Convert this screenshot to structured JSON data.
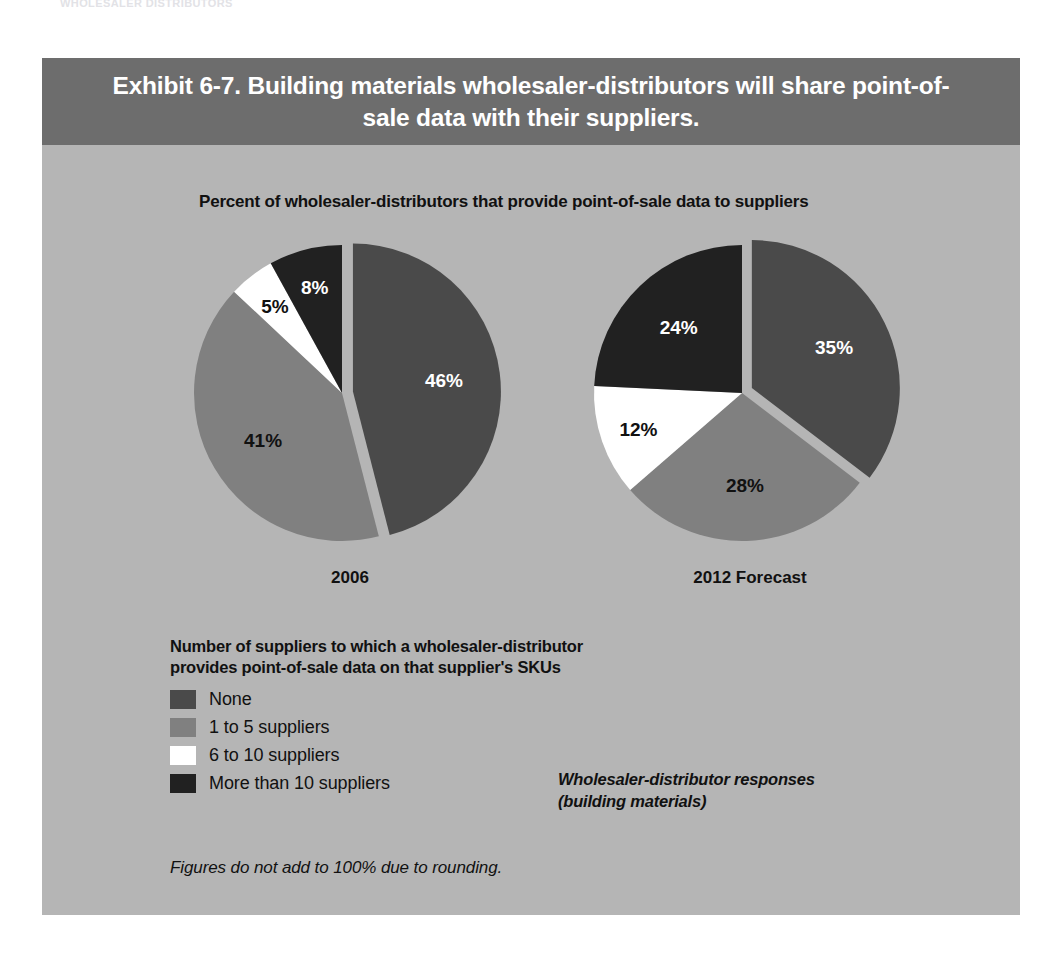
{
  "scan_header_text": "WHOLESALER  DISTRIBUTORS",
  "panel": {
    "title": "Exhibit 6-7. Building materials wholesaler-distributors will share point-of-sale data with their suppliers.",
    "subtitle": "Percent of wholesaler-distributors that provide point-of-sale data to suppliers",
    "source_note_line1": "Wholesaler-distributor responses",
    "source_note_line2": "(building materials)",
    "footnote": "Figures do not add to 100% due to rounding."
  },
  "legend": {
    "title_line1": "Number of suppliers to which a wholesaler-distributor",
    "title_line2": "provides point-of-sale data on that supplier's SKUs",
    "items": [
      {
        "label": "None",
        "color": "#4a4a4a"
      },
      {
        "label": "1 to 5 suppliers",
        "color": "#808080"
      },
      {
        "label": "6 to 10 suppliers",
        "color": "#ffffff"
      },
      {
        "label": "More than 10 suppliers",
        "color": "#212121"
      }
    ]
  },
  "colors": {
    "panel_background": "#b5b5b5",
    "header_band": "#6d6d6d",
    "none": "#4a4a4a",
    "one_to_five": "#808080",
    "six_to_ten": "#ffffff",
    "more_than_ten": "#212121",
    "text_dark": "#111111",
    "text_light": "#ffffff"
  },
  "chart_data": [
    {
      "type": "pie",
      "title": "2006",
      "categories": [
        "None",
        "1 to 5 suppliers",
        "6 to 10 suppliers",
        "More than 10 suppliers"
      ],
      "values": [
        46,
        41,
        5,
        8
      ],
      "labels": [
        "46%",
        "41%",
        "5%",
        "8%"
      ],
      "colors": [
        "#4a4a4a",
        "#808080",
        "#ffffff",
        "#212121"
      ],
      "exploded_slice": "None",
      "units": "percent",
      "note": "Figures do not add to 100% due to rounding."
    },
    {
      "type": "pie",
      "title": "2012 Forecast",
      "categories": [
        "None",
        "1 to 5 suppliers",
        "6 to 10 suppliers",
        "More than 10 suppliers"
      ],
      "values": [
        35,
        28,
        12,
        24
      ],
      "labels": [
        "35%",
        "28%",
        "12%",
        "24%"
      ],
      "colors": [
        "#4a4a4a",
        "#808080",
        "#ffffff",
        "#212121"
      ],
      "exploded_slice": "None",
      "units": "percent",
      "note": "Figures do not add to 100% due to rounding."
    }
  ]
}
